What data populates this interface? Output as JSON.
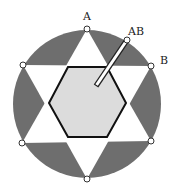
{
  "diagram": {
    "labels": {
      "a": "A",
      "ab": "AB",
      "b": "B"
    },
    "colors": {
      "outer_fill": "#6e6e6e",
      "star_fill": "#ffffff",
      "hexagon_fill": "#dcdcdc",
      "hexagon_stroke": "#111111",
      "point_fill": "#ffffff",
      "point_stroke": "#333333"
    },
    "circle": {
      "cx": 87,
      "cy": 104,
      "r": 74
    },
    "points_count": 6,
    "has_slit_to_center": true
  }
}
